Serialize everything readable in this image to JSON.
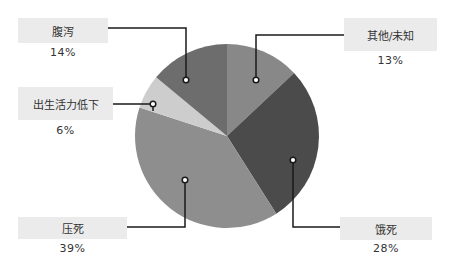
{
  "chart_data": {
    "type": "pie",
    "title": "",
    "slices": [
      {
        "label": "其他/未知",
        "value": 13,
        "pct_label": "13%",
        "color": "#888888"
      },
      {
        "label": "饿死",
        "value": 28,
        "pct_label": "28%",
        "color": "#4b4b4b"
      },
      {
        "label": "压死",
        "value": 39,
        "pct_label": "39%",
        "color": "#8e8e8e"
      },
      {
        "label": "出生活力低下",
        "value": 6,
        "pct_label": "6%",
        "color": "#cdcdcd"
      },
      {
        "label": "腹泻",
        "value": 14,
        "pct_label": "14%",
        "color": "#6d6d6d"
      }
    ],
    "start_angle_deg": 0,
    "direction": "clockwise",
    "legend": "callout labels with leader lines"
  },
  "labels": {
    "other": {
      "name": "其他/未知",
      "pct": "13%"
    },
    "starve": {
      "name": "饿死",
      "pct": "28%"
    },
    "crush": {
      "name": "压死",
      "pct": "39%"
    },
    "weak": {
      "name": "出生活力低下",
      "pct": "6%"
    },
    "diarrhea": {
      "name": "腹泻",
      "pct": "14%"
    }
  }
}
